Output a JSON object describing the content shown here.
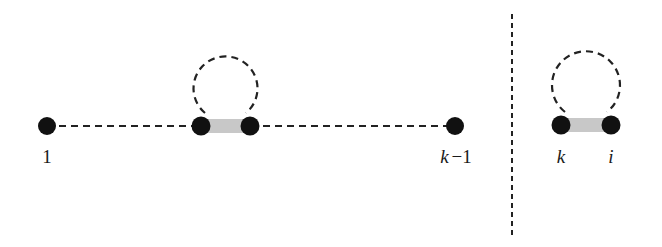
{
  "colors": {
    "background": "#ffffff",
    "node": "#111111",
    "edge": "#222222",
    "bond": "#c8c8c8"
  },
  "left_panel": {
    "nodes": [
      {
        "id": "n1",
        "x": 47,
        "y": 126,
        "label": "1"
      },
      {
        "id": "na",
        "x": 201,
        "y": 126,
        "label": ""
      },
      {
        "id": "nb",
        "x": 250,
        "y": 126,
        "label": ""
      },
      {
        "id": "nk1",
        "x": 455,
        "y": 126,
        "label": "k − 1"
      }
    ],
    "dashed_line": {
      "x1": 47,
      "y1": 126,
      "x2": 455,
      "y2": 126
    },
    "bond": {
      "x1": 201,
      "x2": 250,
      "y": 126
    },
    "loop": {
      "cx": 225,
      "cy": 84,
      "r": 32
    },
    "labels": {
      "first": "1",
      "last": "k − 1"
    }
  },
  "divider": {
    "x": 512,
    "y1": 14,
    "y2": 236
  },
  "right_panel": {
    "nodes": [
      {
        "id": "nk",
        "x": 561,
        "y": 125,
        "label": "k"
      },
      {
        "id": "ni",
        "x": 611,
        "y": 125,
        "label": "i"
      }
    ],
    "bond": {
      "x1": 561,
      "x2": 611,
      "y": 125
    },
    "loop": {
      "cx": 586,
      "cy": 85,
      "r": 34
    },
    "labels": {
      "k": "k",
      "i": "i"
    }
  }
}
